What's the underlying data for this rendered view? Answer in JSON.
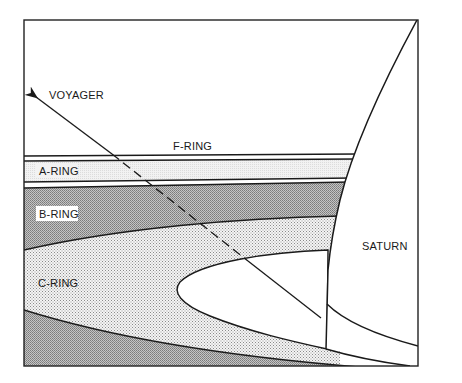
{
  "figure": {
    "type": "schematic"
  },
  "labels": {
    "voyager": "VOYAGER",
    "f_ring": "F-RING",
    "a_ring": "A-RING",
    "b_ring": "B-RING",
    "c_ring": "C-RING",
    "saturn": "SATURN"
  },
  "colors": {
    "frame": "#222222",
    "a_ring_fill": "#ececec",
    "b_ring_fill": "#a8a8a8",
    "c_ring_fill": "#d9d9d9",
    "lower_ring_fill": "#a8a8a8",
    "planet_fill": "#ffffff",
    "background": "#ffffff"
  }
}
